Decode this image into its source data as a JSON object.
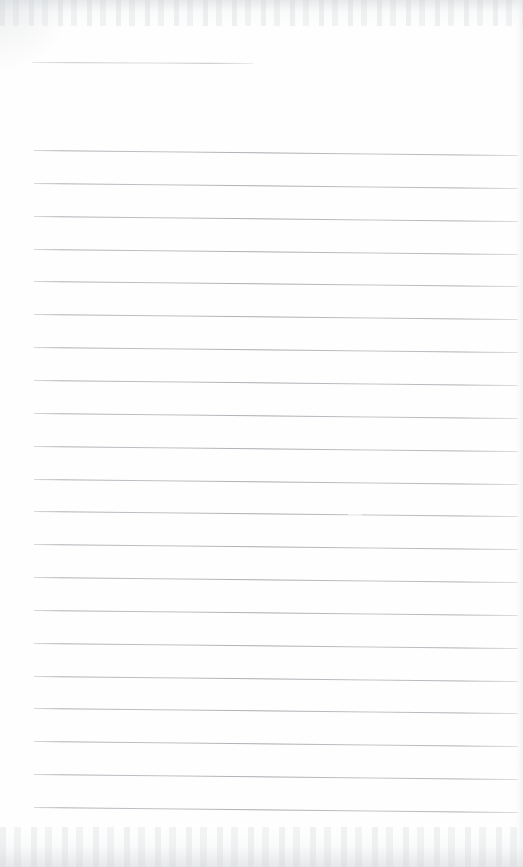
{
  "page": {
    "kind": "scanned-blank-ruled-notebook-page",
    "width": 523,
    "height": 867,
    "background_color": "#fefefe",
    "text_content": "",
    "handwriting_present": "no",
    "printed_text_present": "no"
  },
  "ruling": {
    "line_color": "#b9bdc1",
    "line_thickness_px": 1,
    "left_x": 34,
    "right_x": 518,
    "slope_drop_px": 5,
    "body_line_count": 21,
    "first_body_line_y": 150,
    "last_body_line_y": 809,
    "line_spacing_px": 32.85
  },
  "header_rule": {
    "label": "header-rule",
    "color": "#c3c7cb",
    "left_x": 32,
    "right_x": 253,
    "y": 62,
    "slope_drop_px": 1
  },
  "artifacts": {
    "scan_noise_top_label": "scan-noise-band-top",
    "scan_noise_bottom_label": "scan-noise-band-bottom",
    "paper_edge_right_label": "paper-edge-right",
    "corner_shade_label": "corner-shade-top-left",
    "rule_gap": {
      "on_line_index": 11,
      "start_x": 348,
      "end_x": 362
    }
  }
}
